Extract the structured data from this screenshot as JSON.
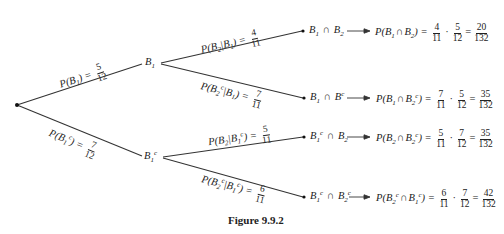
{
  "figure": {
    "caption": "Figure 9.9.2",
    "line_color": "#333333"
  },
  "root": {
    "label": ""
  },
  "level1": [
    {
      "node": {
        "base": "B",
        "sub": "1",
        "sup": ""
      },
      "edge_label": {
        "prefix": "P(B",
        "sub": "1",
        "sup": "",
        "suffix": ") =",
        "num": "5",
        "den": "12"
      }
    },
    {
      "node": {
        "base": "B",
        "sub": "1",
        "sup": "c"
      },
      "edge_label": {
        "prefix": "P(B",
        "sub": "1",
        "sup": "c",
        "suffix": ") =",
        "num": "7",
        "den": "12"
      }
    }
  ],
  "level2": [
    {
      "edge_label": {
        "text_a": "P(B",
        "sub_a": "2",
        "sup_a": "",
        "mid": "|B",
        "sub_b": "1",
        "sup_b": "",
        "suffix": ") =",
        "num": "4",
        "den": "11"
      },
      "outcome": {
        "a": "B",
        "a_sub": "1",
        "a_sup": "",
        "op": "∩",
        "b": "B",
        "b_sub": "2",
        "b_sup": ""
      },
      "result": {
        "lhs_a": "P(B",
        "lhs_a_sub": "1",
        "lhs_a_sup": "",
        "lhs_op": "∩",
        "lhs_b": "B",
        "lhs_b_sub": "2",
        "lhs_b_sup": "",
        "lhs_end": ") =",
        "f1_num": "4",
        "f1_den": "11",
        "f2_num": "5",
        "f2_den": "12",
        "r_num": "20",
        "r_den": "132"
      }
    },
    {
      "edge_label": {
        "text_a": "P(B",
        "sub_a": "2",
        "sup_a": "c",
        "mid": "|B",
        "sub_b": "1",
        "sup_b": "",
        "suffix": ") =",
        "num": "7",
        "den": "11"
      },
      "outcome": {
        "a": "B",
        "a_sub": "1",
        "a_sup": "",
        "op": "∩",
        "b": "B",
        "b_sub": "",
        "b_sup": "c"
      },
      "result": {
        "lhs_a": "P(B",
        "lhs_a_sub": "1",
        "lhs_a_sup": "",
        "lhs_op": "∩",
        "lhs_b": "B",
        "lhs_b_sub": "2",
        "lhs_b_sup": "c",
        "lhs_end": ") =",
        "f1_num": "7",
        "f1_den": "11",
        "f2_num": "5",
        "f2_den": "12",
        "r_num": "35",
        "r_den": "132"
      }
    },
    {
      "edge_label": {
        "text_a": "P(B",
        "sub_a": "2",
        "sup_a": "",
        "mid": "|B",
        "sub_b": "1",
        "sup_b": "c",
        "suffix": ") =",
        "num": "5",
        "den": "11"
      },
      "outcome": {
        "a": "B",
        "a_sub": "1",
        "a_sup": "c",
        "op": "∩",
        "b": "B",
        "b_sub": "2",
        "b_sup": ""
      },
      "result": {
        "lhs_a": "P(B",
        "lhs_a_sub": "2",
        "lhs_a_sup": "",
        "lhs_op": "∩",
        "lhs_b": "B",
        "lhs_b_sub": "2",
        "lhs_b_sup": "c",
        "lhs_end": ") =",
        "f1_num": "5",
        "f1_den": "11",
        "f2_num": "7",
        "f2_den": "12",
        "r_num": "35",
        "r_den": "132"
      }
    },
    {
      "edge_label": {
        "text_a": "P(B",
        "sub_a": "2",
        "sup_a": "c",
        "mid": "|B",
        "sub_b": "1",
        "sup_b": "c",
        "suffix": ") =",
        "num": "6",
        "den": "11"
      },
      "outcome": {
        "a": "B",
        "a_sub": "1",
        "a_sup": "c",
        "op": "∩",
        "b": "B",
        "b_sub": "2",
        "b_sup": "c"
      },
      "result": {
        "lhs_a": "P(B",
        "lhs_a_sub": "2",
        "lhs_a_sup": "c",
        "lhs_op": "∩",
        "lhs_b": "B",
        "lhs_b_sub": "1",
        "lhs_b_sup": "c",
        "lhs_end": ") =",
        "f1_num": "6",
        "f1_den": "11",
        "f2_num": "7",
        "f2_den": "12",
        "r_num": "42",
        "r_den": "132"
      }
    }
  ],
  "operators": {
    "times": "·",
    "equals": "="
  }
}
